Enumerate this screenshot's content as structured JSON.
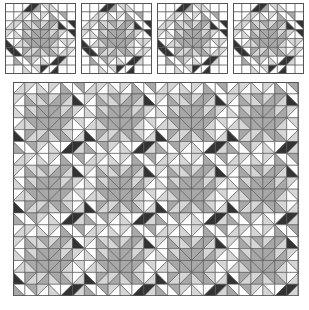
{
  "colors": {
    "W": "#ffffff",
    "L": "#d6d6d6",
    "M": "#a8a8a8",
    "D": "#333333",
    "grid": "#555555"
  },
  "block_grid": [
    [
      "W|W|W",
      "W|W|W",
      "/|W|D",
      "/|D|M",
      "\\|L|W",
      "\\|W|L",
      "W|W|W",
      "W|W|W"
    ],
    [
      "W|W|W",
      "/|W|L",
      "/|L|W",
      "\\|W|L",
      "/|L|W",
      "\\|W|M",
      "\\|M|W",
      "W|W|W"
    ],
    [
      "/|W|L",
      "/|L|W",
      "\\|L|M",
      "\\|M|L",
      "/|L|M",
      "/|M|L",
      "\\|W|D",
      "\\|D|W"
    ],
    [
      "/|L|W",
      "\\|W|L",
      "\\|L|M",
      "\\|M|M",
      "/|M|M",
      "/|L|M",
      "/|L|W",
      "\\|D|W"
    ],
    [
      "\\|W|D",
      "/|W|L",
      "\\|M|L",
      "\\|M|M",
      "/|M|M",
      "/|M|L",
      "\\|L|W",
      "/|L|W"
    ],
    [
      "\\|D|W",
      "\\|W|D",
      "/|M|L",
      "/|L|M",
      "\\|M|L",
      "\\|L|M",
      "/|W|L",
      "/|L|W"
    ],
    [
      "W|W|W",
      "\\|W|M",
      "\\|M|W",
      "/|L|W",
      "\\|W|L",
      "/|W|D",
      "/|D|L",
      "W|W|W"
    ],
    [
      "W|W|W",
      "W|W|W",
      "\\|W|L",
      "\\|L|W",
      "/|D|W",
      "/|W|D",
      "W|W|W",
      "W|W|W"
    ]
  ],
  "samples": [
    {
      "x": 5,
      "y": 3,
      "size": 71
    },
    {
      "x": 81,
      "y": 3,
      "size": 71
    },
    {
      "x": 157,
      "y": 3,
      "size": 71
    },
    {
      "x": 233,
      "y": 3,
      "size": 71
    }
  ],
  "quilt": {
    "x": 13,
    "y": 82,
    "cols": 24,
    "rows": 18,
    "cell": 11.9,
    "period": 6
  }
}
